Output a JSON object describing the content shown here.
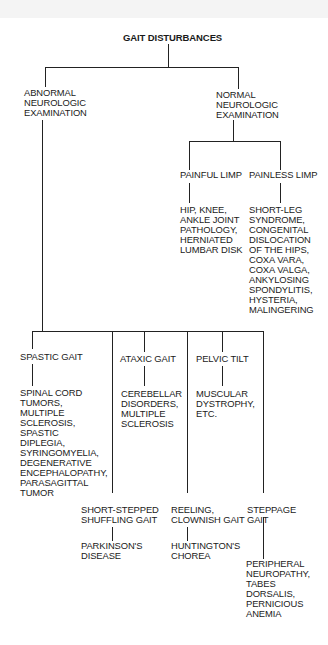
{
  "title": "GAIT DISTURBANCES",
  "branches": {
    "abnormal": "ABNORMAL\nNEUROLOGIC\nEXAMINATION",
    "normal": "NORMAL\nNEUROLOGIC\nEXAMINATION"
  },
  "normal_children": {
    "painful": {
      "label": "PAINFUL LIMP",
      "causes": "HIP, KNEE,\nANKLE JOINT\nPATHOLOGY,\nHERNIATED\nLUMBAR DISK"
    },
    "painless": {
      "label": "PAINLESS LIMP",
      "causes": "SHORT-LEG\nSYNDROME,\nCONGENITAL\nDISLOCATION\nOF THE HIPS,\nCOXA VARA,\nCOXA VALGA,\nANKYLOSING\nSPONDYLITIS,\nHYSTERIA,\nMALINGERING"
    }
  },
  "abnormal_children": {
    "spastic": {
      "label": "SPASTIC GAIT",
      "causes": "SPINAL CORD\nTUMORS,\nMULTIPLE\nSCLEROSIS,\nSPASTIC\nDIPLEGIA,\nSYRINGOMYELIA,\nDEGENERATIVE\nENCEPHALOPATHY,\nPARASAGITTAL\nTUMOR"
    },
    "ataxic": {
      "label": "ATAXIC GAIT",
      "causes": "CEREBELLAR\nDISORDERS,\nMULTIPLE\nSCLEROSIS"
    },
    "pelvic": {
      "label": "PELVIC TILT",
      "causes": "MUSCULAR\nDYSTROPHY,\nETC."
    },
    "shuffling": {
      "label": "SHORT-STEPPED\nSHUFFLING GAIT",
      "causes": "PARKINSON'S\nDISEASE"
    },
    "reeling": {
      "label": "REELING,\nCLOWNISH GAIT",
      "causes": "HUNTINGTON'S\nCHOREA"
    },
    "steppage": {
      "label": "STEPPAGE\nGAIT",
      "causes": "PERIPHERAL\nNEUROPATHY,\nTABES\nDORSALIS,\nPERNICIOUS\nANEMIA"
    }
  }
}
